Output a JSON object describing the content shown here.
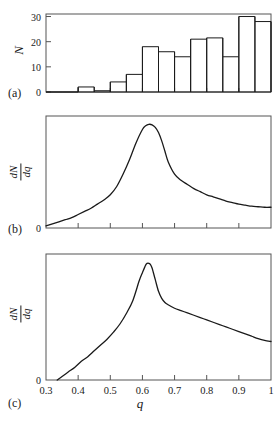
{
  "figure": {
    "panels": [
      {
        "tag": "(a)",
        "ylabel": "N",
        "ylabel_type": "plain"
      },
      {
        "tag": "(b)",
        "ylabel_num": "dN",
        "ylabel_den": "dq",
        "ylabel_type": "fraction"
      },
      {
        "tag": "(c)",
        "ylabel_num": "dN",
        "ylabel_den": "dq",
        "ylabel_type": "fraction"
      }
    ],
    "xlabel": "q",
    "line_color": "#1a1a1a",
    "frame_color": "#555555",
    "background": "#ffffff"
  },
  "chart_data": [
    {
      "type": "bar",
      "panel": "(a)",
      "title": "",
      "xlabel": "q",
      "ylabel": "N",
      "xlim": [
        0.3,
        1.0
      ],
      "ylim": [
        0,
        31
      ],
      "yticks": [
        0,
        10,
        20,
        30
      ],
      "ytick_labels": [
        "0",
        "10",
        "20",
        "30"
      ],
      "xticks": [
        0.3,
        0.4,
        0.5,
        0.6,
        0.7,
        0.8,
        0.9,
        1.0
      ],
      "xtick_labels": [
        "",
        "",
        "",
        "",
        "",
        "",
        "",
        ""
      ],
      "grid": false,
      "bin_width": 0.05,
      "bin_edges": [
        0.3,
        0.35,
        0.4,
        0.45,
        0.5,
        0.55,
        0.6,
        0.65,
        0.7,
        0.75,
        0.8,
        0.85,
        0.9,
        0.95,
        1.0
      ],
      "categories": [
        "0.30-0.35",
        "0.35-0.40",
        "0.40-0.45",
        "0.45-0.50",
        "0.50-0.55",
        "0.55-0.60",
        "0.60-0.65",
        "0.65-0.70",
        "0.70-0.75",
        "0.75-0.80",
        "0.80-0.85",
        "0.85-0.90",
        "0.90-0.95",
        "0.95-1.00"
      ],
      "values": [
        0,
        0,
        2,
        0.5,
        4,
        7,
        18,
        16,
        14,
        21,
        21.5,
        14,
        30,
        28
      ]
    },
    {
      "type": "line",
      "panel": "(b)",
      "title": "",
      "xlabel": "q",
      "ylabel": "dN/dq",
      "xlim": [
        0.3,
        1.0
      ],
      "ylim": [
        0,
        1.08
      ],
      "yticks": [
        0
      ],
      "ytick_labels": [
        "0"
      ],
      "xticks": [
        0.3,
        0.4,
        0.5,
        0.6,
        0.7,
        0.8,
        0.9,
        1.0
      ],
      "xtick_labels": [
        "",
        "",
        "",
        "",
        "",
        "",
        "",
        ""
      ],
      "grid": false,
      "description": "broad asymmetric peak, rounded maximum near q=0.62",
      "x": [
        0.3,
        0.32,
        0.34,
        0.36,
        0.38,
        0.4,
        0.42,
        0.44,
        0.46,
        0.48,
        0.5,
        0.52,
        0.54,
        0.56,
        0.58,
        0.6,
        0.61,
        0.62,
        0.63,
        0.64,
        0.65,
        0.66,
        0.67,
        0.68,
        0.7,
        0.72,
        0.74,
        0.76,
        0.78,
        0.8,
        0.82,
        0.84,
        0.86,
        0.88,
        0.9,
        0.92,
        0.94,
        0.96,
        0.98,
        1.0
      ],
      "y": [
        0.02,
        0.04,
        0.06,
        0.08,
        0.1,
        0.13,
        0.16,
        0.19,
        0.23,
        0.27,
        0.32,
        0.4,
        0.52,
        0.66,
        0.82,
        0.95,
        0.985,
        1.0,
        0.995,
        0.97,
        0.92,
        0.84,
        0.74,
        0.64,
        0.52,
        0.46,
        0.42,
        0.38,
        0.35,
        0.32,
        0.3,
        0.28,
        0.26,
        0.245,
        0.23,
        0.22,
        0.21,
        0.205,
        0.2,
        0.2
      ]
    },
    {
      "type": "line",
      "panel": "(c)",
      "title": "",
      "xlabel": "q",
      "ylabel": "dN/dq",
      "xlim": [
        0.3,
        1.0
      ],
      "ylim": [
        0,
        1.08
      ],
      "yticks": [
        0
      ],
      "ytick_labels": [
        "0"
      ],
      "xticks": [
        0.3,
        0.4,
        0.5,
        0.6,
        0.7,
        0.8,
        0.9,
        1.0
      ],
      "xtick_labels": [
        "0.3",
        "0.4",
        "0.5",
        "0.6",
        "0.7",
        "0.8",
        "0.9",
        "1"
      ],
      "grid": false,
      "description": "sharp cusp-like peak near q=0.62 with shoulder on descending side, curve reaches zero at q=0.34",
      "x": [
        0.335,
        0.35,
        0.37,
        0.39,
        0.41,
        0.43,
        0.45,
        0.47,
        0.49,
        0.51,
        0.53,
        0.55,
        0.57,
        0.59,
        0.6,
        0.61,
        0.615,
        0.62,
        0.625,
        0.63,
        0.64,
        0.65,
        0.66,
        0.67,
        0.68,
        0.7,
        0.72,
        0.74,
        0.76,
        0.78,
        0.8,
        0.82,
        0.84,
        0.86,
        0.88,
        0.9,
        0.92,
        0.94,
        0.96,
        0.98,
        1.0
      ],
      "y": [
        0.0,
        0.03,
        0.07,
        0.11,
        0.16,
        0.2,
        0.25,
        0.3,
        0.35,
        0.41,
        0.48,
        0.57,
        0.68,
        0.85,
        0.92,
        0.985,
        1.0,
        1.0,
        0.99,
        0.96,
        0.86,
        0.76,
        0.7,
        0.665,
        0.645,
        0.615,
        0.595,
        0.575,
        0.555,
        0.535,
        0.515,
        0.495,
        0.475,
        0.455,
        0.435,
        0.415,
        0.395,
        0.375,
        0.355,
        0.34,
        0.33
      ]
    }
  ]
}
